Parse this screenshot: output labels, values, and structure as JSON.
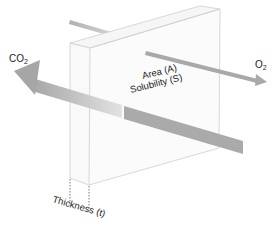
{
  "diagram": {
    "labels": {
      "co2": "CO",
      "co2_sub": "2",
      "o2": "O",
      "o2_sub": "2",
      "area": "Area (A)",
      "solubility": "Solubility (S)",
      "thickness": "Thickness (t)"
    },
    "colors": {
      "slab_edge": "#cfcfcf",
      "slab_face": "#fbfbfb",
      "arrow": "#a9a9a9",
      "arrow_light": "#e0e0e0",
      "dotted": "#555555",
      "text": "#222222"
    }
  }
}
